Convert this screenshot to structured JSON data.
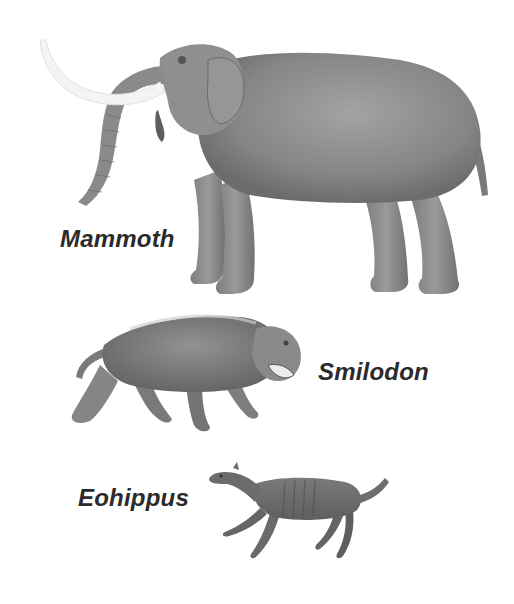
{
  "figure": {
    "background": "#ffffff",
    "animals": [
      {
        "name": "mammoth",
        "label": "Mammoth",
        "body_color": "#8a8a8a",
        "tusk_color": "#f4f4f4"
      },
      {
        "name": "smilodon",
        "label": "Smilodon",
        "body_color": "#7c7c7c"
      },
      {
        "name": "eohippus",
        "label": "Eohippus",
        "body_color": "#6e6e6e"
      }
    ],
    "label_color": "#2b2b2b"
  }
}
